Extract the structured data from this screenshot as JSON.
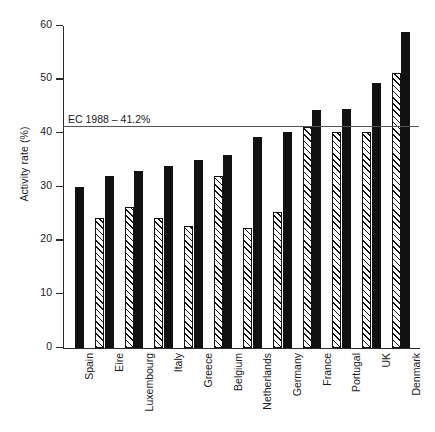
{
  "chart_data": {
    "type": "bar",
    "title": "",
    "subtitle": "",
    "xlabel": "",
    "ylabel": "Activity rate (%)",
    "ylim": [
      0,
      60
    ],
    "yticks": [
      0,
      10,
      20,
      30,
      40,
      50,
      60
    ],
    "ytick_labels": [
      "0",
      "10",
      "20",
      "30",
      "40",
      "50",
      "60"
    ],
    "grid": false,
    "legend_position": "none",
    "categories": [
      "Spain",
      "Eire",
      "Luxembourg",
      "Italy",
      "Greece",
      "Belgium",
      "Netherlands",
      "Germany",
      "France",
      "Portugal",
      "UK",
      "Denmark"
    ],
    "series": [
      {
        "name": "hatched",
        "style": "hatched",
        "values": [
          null,
          24.3,
          26.2,
          24.3,
          22.8,
          32.0,
          22.3,
          25.4,
          41.2,
          40.2,
          40.3,
          51.3
        ]
      },
      {
        "name": "solid",
        "style": "solid",
        "values": [
          30.0,
          32.0,
          33.0,
          34.0,
          35.0,
          36.0,
          39.3,
          40.2,
          44.3,
          44.5,
          49.3,
          58.8
        ]
      }
    ],
    "annotations": [
      {
        "name": "ec-average-line",
        "label": "EC 1988 – 41.2%",
        "value": 41.2,
        "orientation": "horizontal"
      }
    ]
  },
  "axis": {
    "y_title": "Activity rate (%)"
  },
  "reference": {
    "label": "EC 1988 – 41.2%"
  },
  "colors": {
    "bar_solid": "#111111",
    "bar_hatch": "#111111",
    "axis": "#2b2b2b",
    "reference_line": "#555555",
    "background": "#ffffff"
  }
}
